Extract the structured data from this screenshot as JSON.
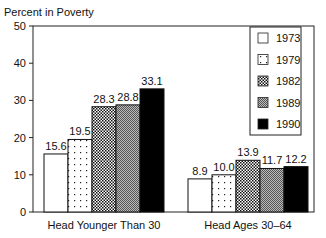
{
  "chart_data": {
    "type": "bar",
    "title": "",
    "ylabel": "Percent in Poverty",
    "xlabel": "",
    "ylim": [
      0,
      50
    ],
    "yticks": [
      0,
      10,
      20,
      30,
      40,
      50
    ],
    "categories": [
      "Head Younger Than 30",
      "Head Ages 30–64"
    ],
    "series": [
      {
        "name": "1973",
        "pattern": "white",
        "values": [
          15.6,
          8.9
        ]
      },
      {
        "name": "1979",
        "pattern": "sparse-dots",
        "values": [
          19.5,
          10.0
        ]
      },
      {
        "name": "1982",
        "pattern": "checker",
        "values": [
          28.3,
          13.9
        ]
      },
      {
        "name": "1989",
        "pattern": "fine-gray",
        "values": [
          28.8,
          11.7
        ]
      },
      {
        "name": "1990",
        "pattern": "black",
        "values": [
          33.1,
          12.2
        ]
      }
    ],
    "value_labels": [
      [
        "15.6",
        "19.5",
        "28.3",
        "28.8",
        "33.1"
      ],
      [
        "8.9",
        "10.0",
        "13.9",
        "11.7",
        "12.2"
      ]
    ],
    "legend_position": "upper-right",
    "grid": false
  }
}
